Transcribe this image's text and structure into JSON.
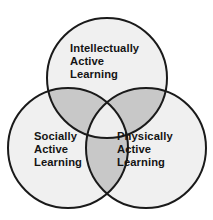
{
  "diagram": {
    "type": "venn",
    "set_count": 3,
    "title_fragment": "▪▪▪▪▪ ▪▪▪▪▪▪",
    "colors": {
      "background": "#ffffff",
      "circle_fill": "#f0f0f0",
      "pairwise_overlap_fill": "#c8c8c8",
      "triple_overlap_fill": "#eeeeee",
      "stroke": "#1a1a1a",
      "text": "#141414"
    },
    "stroke_width": 2,
    "circles": [
      {
        "id": "intellectually-active-learning",
        "cx": 107,
        "cy": 78,
        "r": 60,
        "lines": [
          "Intellectually",
          "Active",
          "Learning"
        ],
        "label_x": 70,
        "label_y": 52
      },
      {
        "id": "socially-active-learning",
        "cx": 68,
        "cy": 148,
        "r": 60,
        "lines": [
          "Socially",
          "Active",
          "Learning"
        ],
        "label_x": 34,
        "label_y": 140
      },
      {
        "id": "physically-active-learning",
        "cx": 146,
        "cy": 148,
        "r": 60,
        "lines": [
          "Physically",
          "Active",
          "Learning"
        ],
        "label_x": 117,
        "label_y": 140
      }
    ],
    "line_height": 13
  }
}
